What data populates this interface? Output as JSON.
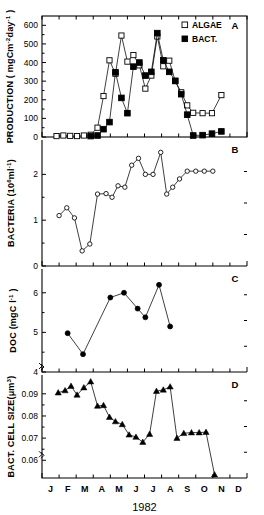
{
  "figure": {
    "year_label": "1982",
    "month_ticks": [
      "J",
      "F",
      "M",
      "A",
      "M",
      "J",
      "J",
      "A",
      "S",
      "O",
      "N",
      "D"
    ]
  },
  "chart_data": [
    {
      "id": "panel_a",
      "type": "line",
      "panel_letter": "A",
      "title": "",
      "xlabel": "1982",
      "ylabel": "PRODUCTION ( mgCm-2day-1 )",
      "ylabel_parts": {
        "main": "PRODUCTION ( mgCm",
        "sup1": "-2",
        "mid": "day",
        "sup2": "-1",
        "tail": " )"
      },
      "ylim": [
        0,
        650
      ],
      "yticks": [
        0,
        100,
        200,
        300,
        400,
        500,
        600
      ],
      "ytick_labels": [
        "0",
        "100",
        "200",
        "300",
        "400",
        "500",
        "600"
      ],
      "xlim": [
        0,
        12
      ],
      "grid": false,
      "legend_position": "top-right",
      "series": [
        {
          "name": "ALGAE",
          "marker": "open-square",
          "x": [
            0.85,
            1.25,
            1.65,
            2.05,
            2.45,
            2.85,
            3.25,
            3.6,
            3.95,
            4.3,
            4.65,
            5.0,
            5.35,
            5.7,
            6.05,
            6.4,
            6.75,
            7.1,
            7.45,
            7.8,
            8.15,
            8.5,
            8.85,
            9.4,
            9.95,
            10.5
          ],
          "y": [
            5,
            8,
            6,
            5,
            8,
            12,
            50,
            220,
            412,
            340,
            545,
            405,
            440,
            385,
            260,
            330,
            540,
            380,
            410,
            300,
            240,
            170,
            130,
            128,
            128,
            225
          ]
        },
        {
          "name": "BACT.",
          "marker": "filled-square",
          "x": [
            2.85,
            3.25,
            3.6,
            3.95,
            4.3,
            4.65,
            5.0,
            5.35,
            5.7,
            6.05,
            6.4,
            6.75,
            7.1,
            7.45,
            7.8,
            8.15,
            8.5,
            8.85,
            9.4,
            9.95,
            10.5
          ],
          "y": [
            5,
            8,
            42,
            80,
            348,
            210,
            128,
            378,
            400,
            330,
            350,
            558,
            412,
            350,
            302,
            230,
            120,
            8,
            10,
            18,
            30
          ]
        }
      ],
      "legend": [
        {
          "label": "ALGAE",
          "marker": "open-square"
        },
        {
          "label": "BACT.",
          "marker": "filled-square"
        }
      ]
    },
    {
      "id": "panel_b",
      "type": "line",
      "panel_letter": "B",
      "title": "",
      "xlabel": "1982",
      "ylabel": "BACTERIA (106ml-1)",
      "ylabel_parts": {
        "main": "BACTERIA (10",
        "sup1": "6",
        "mid": "ml",
        "sup2": "-1",
        "tail": ")"
      },
      "ylim": [
        0,
        2.75
      ],
      "yticks": [
        0,
        1,
        2
      ],
      "ytick_labels": [
        "0",
        "1",
        "2"
      ],
      "xlim": [
        0,
        12
      ],
      "grid": false,
      "series": [
        {
          "name": "BACTERIA",
          "marker": "open-circle",
          "x": [
            1.0,
            1.45,
            1.9,
            2.35,
            2.8,
            3.25,
            3.75,
            4.1,
            4.45,
            4.85,
            5.25,
            5.65,
            6.05,
            6.5,
            6.95,
            7.3,
            7.65,
            8.05,
            8.5,
            9.0,
            9.5,
            10.0
          ],
          "y": [
            1.1,
            1.27,
            1.05,
            0.33,
            0.48,
            1.57,
            1.58,
            1.5,
            1.75,
            1.72,
            2.2,
            2.35,
            2.0,
            2.0,
            2.48,
            1.57,
            1.72,
            1.9,
            2.07,
            2.07,
            2.07,
            2.07
          ]
        }
      ]
    },
    {
      "id": "panel_c",
      "type": "line",
      "panel_letter": "C",
      "title": "",
      "xlabel": "1982",
      "ylabel": "DOC (mgC l-1 )",
      "ylabel_parts": {
        "main": "DOC (mgC l",
        "sup1": "-1",
        "mid": "",
        "sup2": "",
        "tail": " )"
      },
      "ylim": [
        4,
        6.6
      ],
      "yticks": [
        4,
        5,
        6
      ],
      "ytick_labels": [
        "4",
        "5",
        "6"
      ],
      "axis_break": true,
      "xlim": [
        0,
        12
      ],
      "grid": false,
      "series": [
        {
          "name": "DOC",
          "marker": "filled-circle",
          "x": [
            1.5,
            2.4,
            4.0,
            4.8,
            5.6,
            6.05,
            6.85,
            7.5
          ],
          "y": [
            4.98,
            4.45,
            5.88,
            6.0,
            5.6,
            5.38,
            6.2,
            5.15
          ]
        }
      ]
    },
    {
      "id": "panel_d",
      "type": "line",
      "panel_letter": "D",
      "title": "",
      "xlabel": "1982",
      "ylabel": "BACT. CELL SIZE(um3)",
      "ylabel_parts": {
        "main": "BACT. CELL SIZE(μm",
        "sup1": "3",
        "mid": "",
        "sup2": "",
        "tail": ")"
      },
      "ylim": [
        0.052,
        0.0985
      ],
      "yticks": [
        0.06,
        0.07,
        0.08,
        0.09
      ],
      "ytick_labels": [
        "0.06",
        "0.07",
        "0.08",
        "0.09"
      ],
      "axis_break": true,
      "xlim": [
        0,
        12
      ],
      "grid": false,
      "series": [
        {
          "name": "BACT. CELL SIZE",
          "marker": "filled-triangle",
          "x": [
            0.95,
            1.35,
            1.7,
            2.05,
            2.45,
            2.85,
            3.25,
            3.6,
            3.95,
            4.3,
            4.7,
            5.1,
            5.5,
            5.9,
            6.3,
            6.7,
            7.1,
            7.5,
            7.9,
            8.3,
            8.75,
            9.2,
            9.6,
            10.1
          ],
          "y": [
            0.0905,
            0.0915,
            0.0935,
            0.0895,
            0.0928,
            0.0955,
            0.0845,
            0.0848,
            0.0795,
            0.0775,
            0.0762,
            0.0715,
            0.0705,
            0.0682,
            0.0718,
            0.0912,
            0.0918,
            0.0932,
            0.07,
            0.0722,
            0.0725,
            0.0725,
            0.0727,
            0.0535
          ]
        }
      ]
    }
  ]
}
